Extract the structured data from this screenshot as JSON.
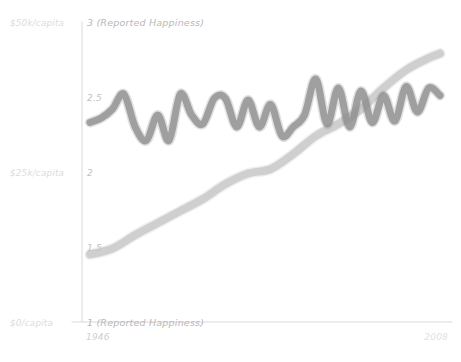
{
  "chart_data": {
    "type": "line",
    "title": "",
    "xlabel": "",
    "ylabel": "",
    "xlim": [
      1946,
      2008
    ],
    "ylim": [
      1,
      3
    ],
    "grid": false,
    "legend_position": "none",
    "axis_left_labels": [
      {
        "text": "$50k/capita",
        "value": 3
      },
      {
        "text": "$25k/capita",
        "value": 2
      },
      {
        "text": "$0/capita",
        "value": 1
      }
    ],
    "y_tick_labels": [
      {
        "text": "3 (Reported Happiness)",
        "value": 3
      },
      {
        "text": "2.5",
        "value": 2.5
      },
      {
        "text": "2",
        "value": 2
      },
      {
        "text": "1.5",
        "value": 1.5
      },
      {
        "text": "1 (Reported Happiness)",
        "value": 1
      }
    ],
    "x_tick_labels": [
      {
        "text": "1946",
        "value": 1946
      },
      {
        "text": "2008",
        "value": 2008
      }
    ],
    "series": [
      {
        "name": "Reported Happiness",
        "color": "#909090",
        "stroke_width": 7,
        "opacity": 0.82,
        "x": [
          1946,
          1948,
          1950,
          1952,
          1954,
          1956,
          1958,
          1960,
          1962,
          1964,
          1966,
          1968,
          1970,
          1972,
          1974,
          1976,
          1978,
          1980,
          1982,
          1984,
          1986,
          1988,
          1990,
          1992,
          1994,
          1996,
          1998,
          2000,
          2002,
          2004,
          2006,
          2008
        ],
        "values": [
          2.33,
          2.36,
          2.42,
          2.52,
          2.3,
          2.21,
          2.38,
          2.21,
          2.52,
          2.38,
          2.32,
          2.49,
          2.49,
          2.3,
          2.48,
          2.3,
          2.45,
          2.24,
          2.3,
          2.38,
          2.62,
          2.32,
          2.56,
          2.3,
          2.54,
          2.33,
          2.51,
          2.34,
          2.57,
          2.4,
          2.56,
          2.51
        ]
      },
      {
        "name": "GDP per capita",
        "color": "#c9c9c9",
        "stroke_width": 8,
        "opacity": 0.85,
        "x": [
          1946,
          1950,
          1954,
          1958,
          1962,
          1966,
          1970,
          1974,
          1978,
          1982,
          1986,
          1990,
          1994,
          1998,
          2002,
          2006,
          2008
        ],
        "values": [
          1.45,
          1.49,
          1.58,
          1.66,
          1.74,
          1.82,
          1.92,
          1.99,
          2.02,
          2.12,
          2.24,
          2.32,
          2.42,
          2.56,
          2.68,
          2.76,
          2.79
        ]
      }
    ]
  },
  "axis": {
    "y_axis_name": "y-axis",
    "x_axis_name": "x-axis"
  }
}
